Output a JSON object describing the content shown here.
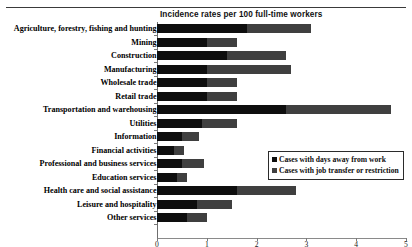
{
  "chart_data": {
    "type": "bar",
    "subtype": "horizontal-stacked-bar",
    "title": "Incidence rates per 100 full-time workers",
    "xlabel": "",
    "ylabel": "",
    "xlim": [
      0,
      5
    ],
    "xticks": [
      "0",
      "1",
      "2",
      "3",
      "4",
      "5"
    ],
    "grid": false,
    "legend_position": "center-right",
    "categories": [
      "Agriculture, forestry, fishing and hunting",
      "Mining",
      "Construction",
      "Manufacturing",
      "Wholesale trade",
      "Retail trade",
      "Transportation and warehousing",
      "Utilities",
      "Information",
      "Financial activities",
      "Professional and business services",
      "Education services",
      "Health care and social assistance",
      "Leisure and hospitality",
      "Other services"
    ],
    "series": [
      {
        "name": "Cases with days away from work",
        "color": "#0e0e0e",
        "values": [
          1.8,
          1.0,
          1.4,
          1.0,
          1.0,
          1.0,
          2.6,
          0.9,
          0.5,
          0.35,
          0.5,
          0.4,
          1.6,
          0.8,
          0.6
        ]
      },
      {
        "name": "Cases with job transfer or restriction",
        "color": "#3f3f3f",
        "values": [
          1.3,
          0.6,
          1.2,
          1.7,
          0.6,
          0.6,
          2.1,
          0.7,
          0.35,
          0.2,
          0.45,
          0.2,
          1.2,
          0.7,
          0.4
        ]
      }
    ],
    "totals": [
      3.1,
      1.6,
      2.6,
      2.7,
      1.6,
      1.6,
      4.7,
      1.6,
      0.85,
      0.55,
      0.95,
      0.6,
      2.8,
      1.5,
      1.0
    ]
  },
  "legend": {
    "items": [
      {
        "label": "Cases with days away from work",
        "color": "#0e0e0e"
      },
      {
        "label": "Cases with job transfer or restriction",
        "color": "#3f3f3f"
      }
    ]
  }
}
